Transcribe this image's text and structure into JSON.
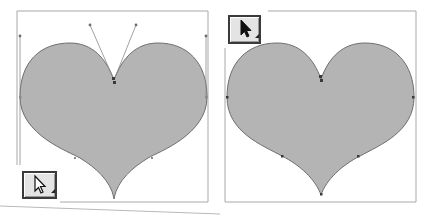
{
  "panels": [
    {
      "name": "heart-with-handles",
      "tool": "direct-selection-tool",
      "tool_icon": "hollow-arrow-icon",
      "fill": "#b4b4b4",
      "stroke": "#6e6e6e",
      "frame": [
        17,
        11,
        208,
        202
      ]
    },
    {
      "name": "heart-anchor-points",
      "tool": "selection-tool",
      "tool_icon": "solid-arrow-icon",
      "fill": "#b4b4b4",
      "stroke": "#6e6e6e",
      "frame": [
        225,
        11,
        416,
        202
      ]
    }
  ],
  "colors": {
    "frame": "#a8a8a8",
    "handle": "#8a8a8a",
    "anchor": "#3a3a3a",
    "tool_bg": "#e4e4e4",
    "tool_border": "#3a3a3a"
  }
}
